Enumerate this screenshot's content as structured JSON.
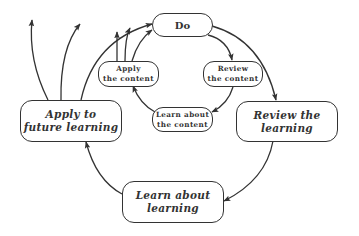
{
  "diagram": {
    "type": "cycle",
    "inner_cycle": {
      "nodes": [
        {
          "id": "do",
          "label": "Do"
        },
        {
          "id": "review_content",
          "label_line1": "Review",
          "label_line2": "the content"
        },
        {
          "id": "learn_content",
          "label_line1": "Learn about",
          "label_line2": "the content"
        },
        {
          "id": "apply_content",
          "label_line1": "Apply",
          "label_line2": "the content"
        }
      ]
    },
    "outer_cycle": {
      "nodes": [
        {
          "id": "review_learning",
          "label_line1": "Review the",
          "label_line2": "learning"
        },
        {
          "id": "learn_learning",
          "label_line1": "Learn about",
          "label_line2": "learning"
        },
        {
          "id": "apply_future",
          "label_line1": "Apply to",
          "label_line2": "future learning"
        }
      ]
    },
    "edges": [
      {
        "from": "do",
        "to": "review_content"
      },
      {
        "from": "review_content",
        "to": "learn_content"
      },
      {
        "from": "learn_content",
        "to": "apply_content"
      },
      {
        "from": "apply_content",
        "to": "do"
      },
      {
        "from": "do",
        "to": "review_learning"
      },
      {
        "from": "review_learning",
        "to": "learn_learning"
      },
      {
        "from": "learn_learning",
        "to": "apply_future"
      },
      {
        "from": "apply_future",
        "to": "do"
      },
      {
        "from": "apply_future",
        "to": "outside"
      }
    ],
    "colors": {
      "stroke": "#333333",
      "fill": "#ffffff"
    }
  }
}
